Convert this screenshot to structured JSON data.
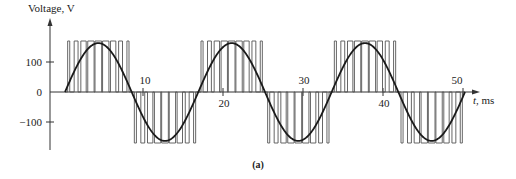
{
  "chart_data": {
    "type": "line",
    "title": "",
    "caption": "(a)",
    "xlabel": "t, ms",
    "xlabel_italic": "t",
    "xlabel_unit": ", ms",
    "ylabel": "Voltage, V",
    "x_ticks": [
      10,
      20,
      30,
      40,
      50
    ],
    "y_ticks": [
      100,
      0,
      -100
    ],
    "y_tick_labels": [
      "100",
      "0",
      "−100"
    ],
    "xlim": [
      0,
      52
    ],
    "ylim": [
      -190,
      190
    ],
    "grid": false,
    "legend": null,
    "series": [
      {
        "name": "Fundamental sine",
        "style": "solid thick",
        "frequency_hz": 60,
        "amplitude": 163,
        "x_start_ms": 0.25,
        "x_end_ms": 50.25
      },
      {
        "name": "PWM pulses",
        "style": "thin vertical pulse train",
        "amplitude": 170,
        "pulses_per_half_cycle": 9
      }
    ]
  },
  "labels": {
    "ylabel": "Voltage, V",
    "xlabel_t": "t",
    "xlabel_unit": ", ms",
    "tick_10": "10",
    "tick_20": "20",
    "tick_30": "30",
    "tick_40": "40",
    "tick_50": "50",
    "ytick_100": "100",
    "ytick_0": "0",
    "ytick_m100": "−100",
    "caption": "(a)"
  },
  "colors": {
    "line": "#222222",
    "pulse": "#555555",
    "background": "#ffffff"
  }
}
